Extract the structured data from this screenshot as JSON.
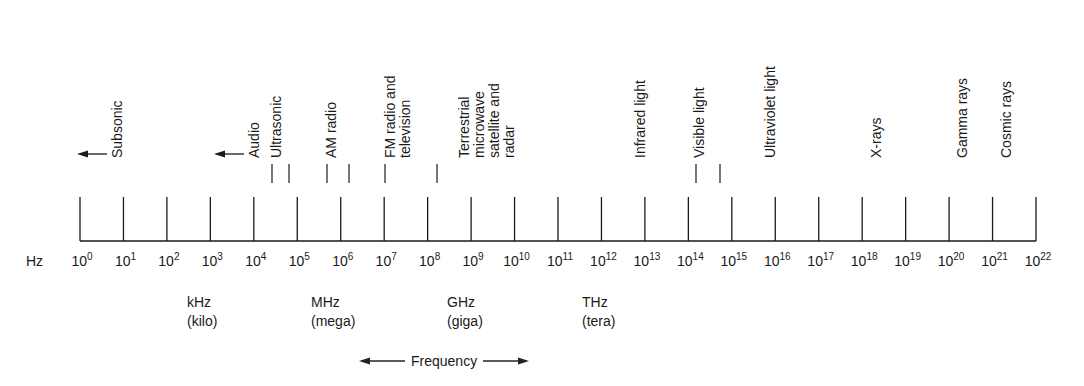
{
  "diagram": {
    "axis": {
      "unit_label": "Hz",
      "base": "10",
      "exponents": [
        "0",
        "1",
        "2",
        "3",
        "4",
        "5",
        "6",
        "7",
        "8",
        "9",
        "10",
        "11",
        "12",
        "13",
        "14",
        "15",
        "16",
        "17",
        "18",
        "19",
        "20",
        "21",
        "22"
      ],
      "x_start": 80,
      "x_end": 1036,
      "baseline_y": 241,
      "tick_top_y": 197
    },
    "bands": [
      {
        "id": "subsonic",
        "label": "Subsonic",
        "x": 117,
        "arrow": "left"
      },
      {
        "id": "audio",
        "label": "Audio",
        "x": 254,
        "arrow": "left"
      },
      {
        "id": "ultrasonic",
        "label": "Ultrasonic",
        "x": 276
      },
      {
        "id": "am-radio",
        "label": "AM radio",
        "x": 331
      },
      {
        "id": "fm-radio-tv",
        "label": "FM radio and\ntelevision",
        "x": 390
      },
      {
        "id": "terrestrial-microwave",
        "label": "Terrestrial\nmicrowave\nsatellite and\nradar",
        "x": 464
      },
      {
        "id": "infrared",
        "label": "Infrared light",
        "x": 640
      },
      {
        "id": "visible",
        "label": "Visible light",
        "x": 699
      },
      {
        "id": "ultraviolet",
        "label": "Ultraviolet light",
        "x": 770
      },
      {
        "id": "x-rays",
        "label": "X-rays",
        "x": 876
      },
      {
        "id": "gamma",
        "label": "Gamma rays",
        "x": 962
      },
      {
        "id": "cosmic",
        "label": "Cosmic rays",
        "x": 1006
      }
    ],
    "band_markers_x": [
      272,
      289,
      327,
      349,
      385,
      437,
      696,
      720
    ],
    "units": [
      {
        "abbr": "kHz",
        "name": "(kilo)",
        "x": 187
      },
      {
        "abbr": "MHz",
        "name": "(mega)",
        "x": 311
      },
      {
        "abbr": "GHz",
        "name": "(giga)",
        "x": 447
      },
      {
        "abbr": "THz",
        "name": "(tera)",
        "x": 582
      }
    ],
    "frequency_label": "Frequency",
    "ink_color": "#1a1a1a"
  }
}
